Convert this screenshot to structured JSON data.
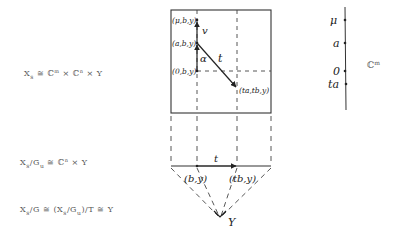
{
  "equations": {
    "eq1": {
      "lhs": "X",
      "lhs_sub": "s",
      "rel": "≅",
      "rhs": "ℂ",
      "rhs_sup1": "m",
      "times": "×",
      "rhs2": "ℂ",
      "rhs_sup2": "n",
      "times2": "×",
      "rhs3": "Y"
    },
    "eq2": {
      "lhs": "X",
      "lhs_sub": "s",
      "slash": "/",
      "g": "G",
      "g_sub": "u",
      "rel": "≅",
      "rhs": "ℂ",
      "rhs_sup": "n",
      "times": "×",
      "rhs2": "Y"
    },
    "eq3": {
      "lhs": "X",
      "lhs_sub": "s",
      "slash": "/G",
      "rel": "≅",
      "open": "(X",
      "inner_sub": "s",
      "inner_slash": "/G",
      "inner_sub2": "u",
      "close": ")/T",
      "rel2": "≅",
      "rhs": "Y"
    }
  },
  "box_labels": {
    "mu_point": "(μ,b,y)",
    "a_point": "(a,b,y)",
    "zero_point": "(0,b,y)",
    "ta_point": "(ta,tb,y)",
    "v_label": "v",
    "alpha_label": "α",
    "t_label": "t"
  },
  "lower_labels": {
    "b_point": "(b,y)",
    "tb_point": "(tb,y)",
    "t_label": "t",
    "y_label": "Y"
  },
  "axis": {
    "labels": [
      "μ",
      "a",
      "0",
      "ta"
    ],
    "space_label": "ℂ",
    "space_sup": "m"
  }
}
